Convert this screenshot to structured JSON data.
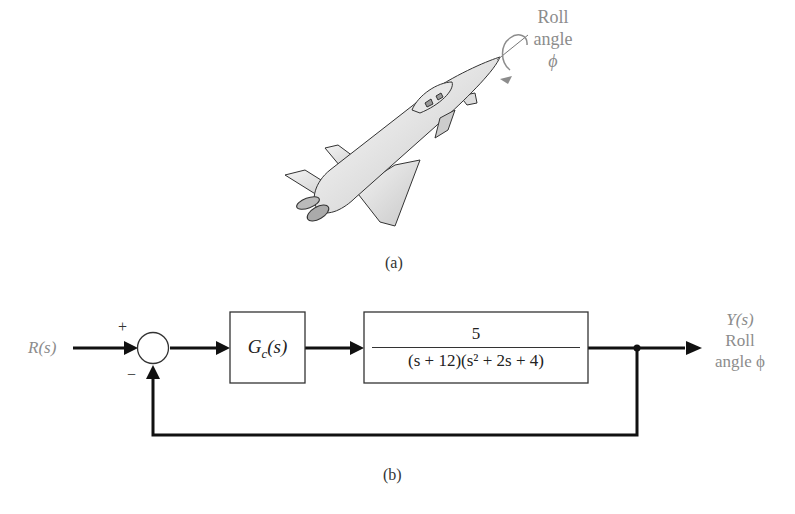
{
  "figure_a": {
    "caption": "(a)",
    "aircraft_label": {
      "line1": "Roll",
      "line2": "angle",
      "line3": "ϕ"
    }
  },
  "figure_b": {
    "caption": "(b)",
    "input_label": "R(s)",
    "sum_signs": {
      "plus": "+",
      "minus": "−"
    },
    "controller": {
      "label_main": "G",
      "label_sub": "c",
      "label_arg": "(s)"
    },
    "plant": {
      "numerator": "5",
      "denominator": "(s + 12)(s² + 2s + 4)"
    },
    "output_label": {
      "line1": "Y(s)",
      "line2": "Roll",
      "line3": "angle ϕ"
    }
  },
  "colors": {
    "line": "#111111",
    "label_gray": "#8c8c8c",
    "text": "#222222"
  }
}
